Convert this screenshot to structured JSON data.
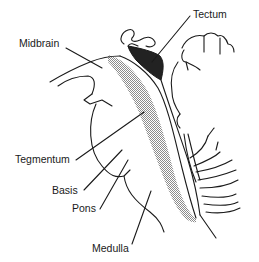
{
  "diagram": {
    "colors": {
      "line": "#1a1a1a",
      "tectum_fill": "#222222",
      "tegmentum_shading": "#9a9a9a",
      "background": "#ffffff"
    },
    "labels": [
      {
        "id": "midbrain",
        "text": "Midbrain",
        "x": 19,
        "y": 49
      },
      {
        "id": "tectum",
        "text": "Tectum",
        "x": 193,
        "y": 18
      },
      {
        "id": "tegmentum",
        "text": "Tegmentum",
        "x": 15,
        "y": 163
      },
      {
        "id": "basis",
        "text": "Basis",
        "x": 52,
        "y": 194
      },
      {
        "id": "pons",
        "text": "Pons",
        "x": 72,
        "y": 212
      },
      {
        "id": "medulla",
        "text": "Medulla",
        "x": 92,
        "y": 252
      }
    ]
  }
}
